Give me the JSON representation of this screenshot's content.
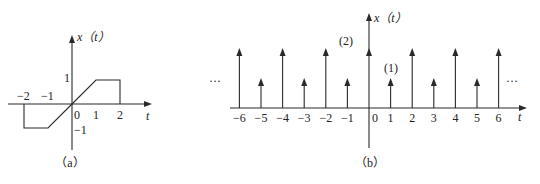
{
  "figure": {
    "panels": [
      {
        "id": "a",
        "caption": "（a）",
        "y_label": "x（t）",
        "x_label": "t",
        "x_ticks": [
          "−2",
          "−1",
          "0",
          "1",
          "2"
        ],
        "y_ticks": [
          "1",
          "−1"
        ]
      },
      {
        "id": "b",
        "caption": "（b）",
        "y_label": "x（t）",
        "x_label": "t",
        "x_ticks": [
          "−6",
          "−5",
          "−4",
          "−3",
          "−2",
          "−1",
          "0",
          "1",
          "2",
          "3",
          "4",
          "5",
          "6"
        ],
        "impulse_labels": [
          "(2)",
          "(1)"
        ],
        "ellipsis_left": "···",
        "ellipsis_right": "···"
      }
    ]
  },
  "chart_data": [
    {
      "type": "line",
      "title": "(a)",
      "xlabel": "t",
      "ylabel": "x(t)",
      "x": [
        -2,
        -2,
        -1,
        0,
        1,
        2,
        2
      ],
      "values": [
        0,
        -1,
        -1,
        0,
        1,
        1,
        0
      ],
      "xlim": [
        -2.5,
        2.5
      ],
      "ylim": [
        -1.5,
        1.5
      ],
      "grid": false
    },
    {
      "type": "bar",
      "subtype": "impulse",
      "title": "(b)",
      "xlabel": "t",
      "ylabel": "x(t)",
      "categories": [
        -6,
        -5,
        -4,
        -3,
        -2,
        -1,
        0,
        1,
        2,
        3,
        4,
        5,
        6
      ],
      "values": [
        2,
        1,
        2,
        1,
        2,
        1,
        2,
        1,
        2,
        1,
        2,
        1,
        2
      ],
      "annotations": [
        "(2) at t=0",
        "(1) at t=1",
        "··· periodic continuation both sides"
      ],
      "grid": false
    }
  ]
}
